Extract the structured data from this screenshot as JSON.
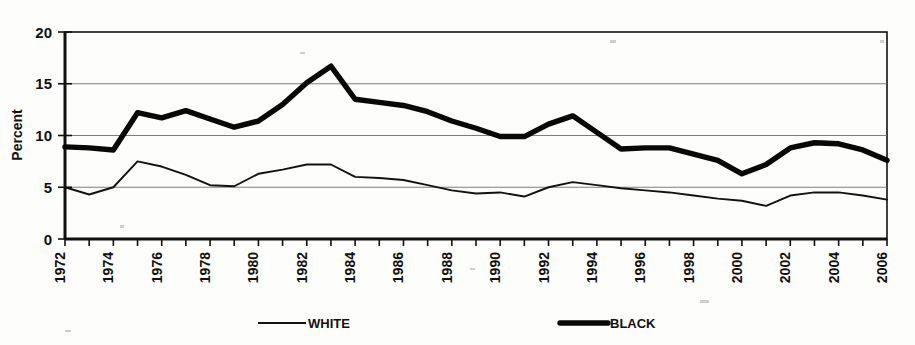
{
  "chart_data": {
    "type": "line",
    "title": "",
    "subtitle": "",
    "xlabel": "",
    "ylabel": "Percent",
    "ylim": [
      0,
      20
    ],
    "yticks": [
      0,
      5,
      10,
      15,
      20
    ],
    "ytick_labels": [
      "0",
      "5",
      "10",
      "15",
      "20"
    ],
    "xlim": [
      1972,
      2006
    ],
    "grid": "horizontal",
    "legend_position": "bottom",
    "x": [
      1972,
      1973,
      1974,
      1975,
      1976,
      1977,
      1978,
      1979,
      1980,
      1981,
      1982,
      1983,
      1984,
      1985,
      1986,
      1987,
      1988,
      1989,
      1990,
      1991,
      1992,
      1993,
      1994,
      1995,
      1996,
      1997,
      1998,
      1999,
      2000,
      2001,
      2002,
      2003,
      2004,
      2005,
      2006
    ],
    "xtick_labels": [
      "1972",
      "1974",
      "1976",
      "1978",
      "1980",
      "1982",
      "1984",
      "1986",
      "1988",
      "1990",
      "1992",
      "1994",
      "1996",
      "1998",
      "2000",
      "2002",
      "2004",
      "2006"
    ],
    "series": [
      {
        "name": "WHITE",
        "style": "thin-line",
        "values": [
          5.0,
          4.3,
          5.0,
          7.5,
          7.0,
          6.2,
          5.2,
          5.1,
          6.3,
          6.7,
          7.2,
          7.2,
          6.0,
          5.9,
          5.7,
          5.2,
          4.7,
          4.4,
          4.5,
          4.1,
          5.0,
          5.5,
          5.2,
          4.9,
          4.7,
          4.5,
          4.2,
          3.9,
          3.7,
          3.2,
          4.2,
          4.5,
          4.5,
          4.2,
          3.8
        ]
      },
      {
        "name": "BLACK",
        "style": "thick-line",
        "values": [
          8.9,
          8.8,
          8.6,
          12.2,
          11.7,
          12.4,
          11.6,
          10.8,
          11.4,
          13.0,
          15.1,
          16.7,
          13.5,
          13.2,
          12.9,
          12.3,
          11.4,
          10.7,
          9.9,
          9.9,
          11.1,
          11.9,
          10.3,
          8.7,
          8.8,
          8.8,
          8.2,
          7.6,
          6.3,
          7.2,
          8.8,
          9.3,
          9.2,
          8.6,
          7.6
        ]
      }
    ],
    "legend": [
      {
        "label": "WHITE",
        "style": "thin-line"
      },
      {
        "label": "BLACK",
        "style": "thick-line"
      }
    ],
    "colors": {
      "series_line": "#111111",
      "grid": "#6f6f6f",
      "background": "#fdfdfb",
      "axis": "#111111"
    }
  }
}
